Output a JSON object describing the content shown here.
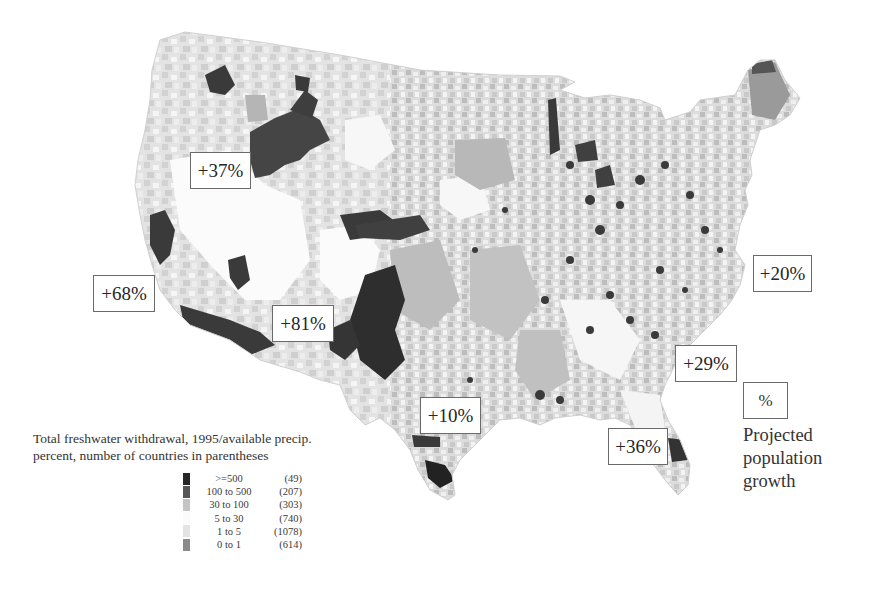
{
  "map": {
    "subject": "Contiguous United States counties shaded by freshwater withdrawal",
    "fill_colors": {
      "ge500": "#262626",
      "100to500": "#565656",
      "30to100": "#bdbdbd",
      "5to30": "#fbfbfb",
      "1to5": "#e3e3e3",
      "0to1": "#8c8c8c"
    }
  },
  "growth_labels": [
    {
      "id": "northwest",
      "text": "+37%"
    },
    {
      "id": "california",
      "text": "+68%"
    },
    {
      "id": "southwest",
      "text": "+81%"
    },
    {
      "id": "texas",
      "text": "+10%"
    },
    {
      "id": "northeast",
      "text": "+20%"
    },
    {
      "id": "southeast",
      "text": "+29%"
    },
    {
      "id": "florida",
      "text": "+36%"
    }
  ],
  "legend": {
    "title_line1": "Total freshwater withdrawal, 1995/available precip.",
    "title_line2": "percent, number of countries in parentheses",
    "items": [
      {
        "range": ">=500",
        "count": "(49)",
        "color": "#262626"
      },
      {
        "range": "100 to 500",
        "count": "(207)",
        "color": "#565656"
      },
      {
        "range": "30 to 100",
        "count": "(303)",
        "color": "#c4c4c4"
      },
      {
        "range": "5 to 30",
        "count": "(740)",
        "color": "#fbfbfb"
      },
      {
        "range": "1 to 5",
        "count": "(1078)",
        "color": "#e3e3e3"
      },
      {
        "range": "0 to 1",
        "count": "(614)",
        "color": "#8a8a8a"
      }
    ]
  },
  "growth_key": {
    "symbol": "%",
    "caption_line1": "Projected",
    "caption_line2": "population",
    "caption_line3": "growth"
  }
}
